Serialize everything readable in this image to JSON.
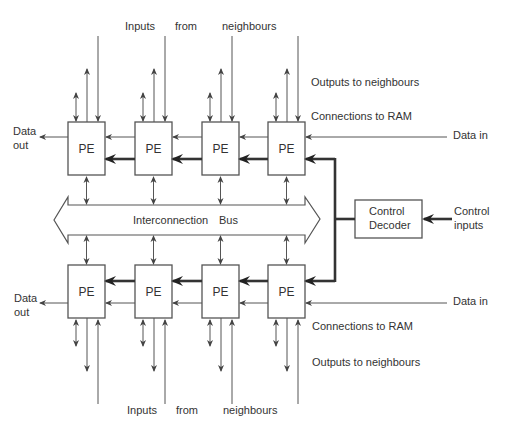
{
  "diagram": {
    "pe_label": "PE",
    "bus_label_1": "Interconnection",
    "bus_label_2": "Bus",
    "control_decoder": {
      "line1": "Control",
      "line2": "Decoder"
    },
    "control_inputs": {
      "line1": "Control",
      "line2": "inputs"
    },
    "top": {
      "inputs_labels": [
        "Inputs",
        "from",
        "neighbours"
      ],
      "outputs_label": "Outputs to neighbours",
      "ram_label": "Connections to RAM",
      "data_in": "Data in",
      "data_out": {
        "line1": "Data",
        "line2": "out"
      }
    },
    "bottom": {
      "inputs_labels": [
        "Inputs",
        "from",
        "neighbours"
      ],
      "outputs_label": "Outputs to neighbours",
      "ram_label": "Connections to RAM",
      "data_in": "Data in",
      "data_out": {
        "line1": "Data",
        "line2": "out"
      }
    },
    "pe_count_per_row": 4
  }
}
